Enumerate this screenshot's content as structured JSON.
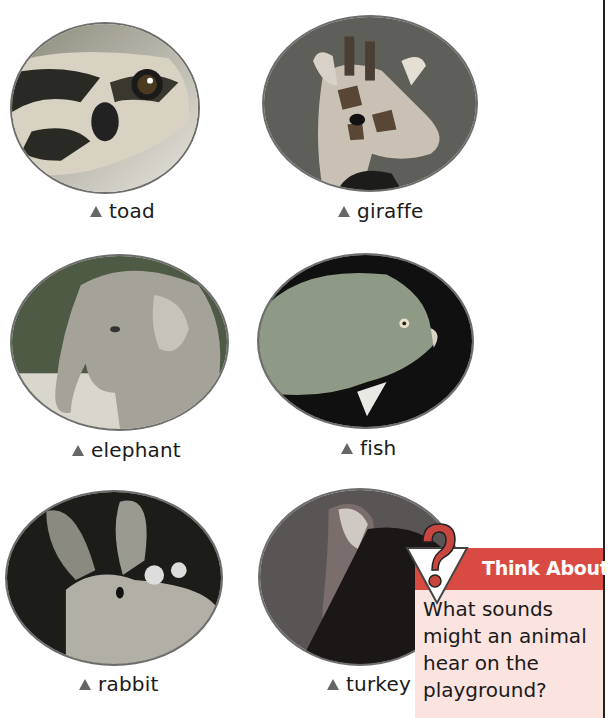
{
  "animals": [
    {
      "name": "toad",
      "label": "toad",
      "marker": "triangle-bullet"
    },
    {
      "name": "giraffe",
      "label": "giraffe",
      "marker": "triangle-bullet"
    },
    {
      "name": "elephant",
      "label": "elephant",
      "marker": "triangle-bullet"
    },
    {
      "name": "fish",
      "label": "fish",
      "marker": "triangle-bullet"
    },
    {
      "name": "rabbit",
      "label": "rabbit",
      "marker": "triangle-bullet"
    },
    {
      "name": "turkey",
      "label": "turkey",
      "marker": "triangle-bullet"
    }
  ],
  "think_box": {
    "title": "Think About It",
    "question": "What sounds might an animal hear on the playground?",
    "icon": "question-mark-triangle-icon",
    "colors": {
      "banner": "#d94b42",
      "background": "#fbe3df"
    }
  }
}
